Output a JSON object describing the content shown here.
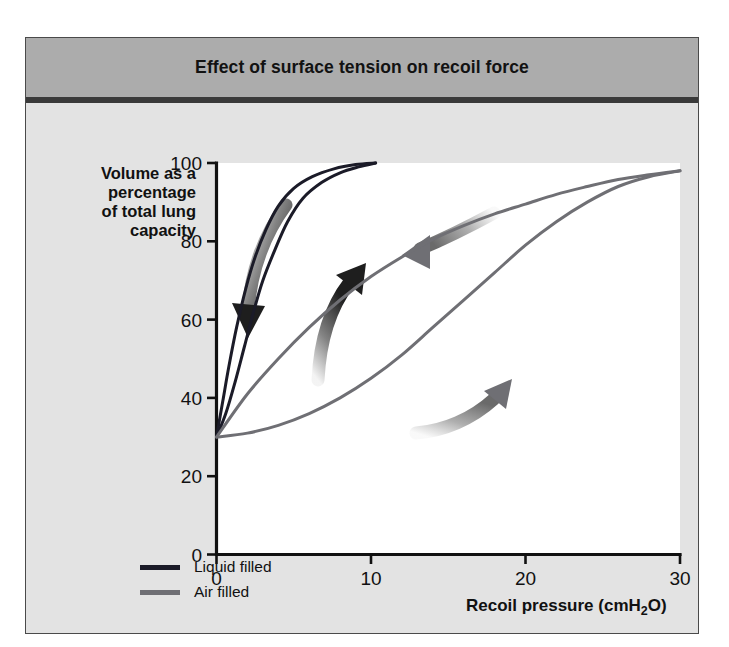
{
  "figure": {
    "title": "Effect of surface tension on recoil force",
    "background_color": "#e3e3e3",
    "title_band_color": "#acacac",
    "plot_background_color": "#ffffff"
  },
  "chart_data": {
    "type": "line",
    "title": "Effect of surface tension on recoil force",
    "xlabel": "Recoil pressure (cmH",
    "xlabel_sub": "2",
    "xlabel_tail": "O)",
    "xlabel_full": "Recoil pressure (cmH2O)",
    "ylabel": "Volume as a percentage of total lung capacity",
    "ylabel_lines": [
      "Volume as a",
      "percentage",
      "of total lung",
      "capacity"
    ],
    "xlim": [
      0,
      30
    ],
    "ylim": [
      0,
      100
    ],
    "xticks": [
      0,
      10,
      20,
      30
    ],
    "xtick_labels": [
      "0",
      "10",
      "20",
      "30"
    ],
    "yticks": [
      0,
      20,
      40,
      60,
      80,
      100
    ],
    "ytick_labels": [
      "0",
      "20",
      "40",
      "60",
      "80",
      "100"
    ],
    "grid": false,
    "legend_position": "below-axes-left",
    "series": [
      {
        "name": "Liquid filled",
        "color": "#1b1b28",
        "limb": "inflation",
        "points": [
          [
            0.0,
            30
          ],
          [
            0.6,
            36
          ],
          [
            1.2,
            44
          ],
          [
            1.8,
            53
          ],
          [
            2.4,
            62
          ],
          [
            3.0,
            70
          ],
          [
            3.8,
            78
          ],
          [
            4.6,
            85
          ],
          [
            5.6,
            91
          ],
          [
            6.8,
            95
          ],
          [
            8.0,
            97.5
          ],
          [
            9.2,
            99
          ],
          [
            10.3,
            100
          ]
        ]
      },
      {
        "name": "Liquid filled",
        "color": "#1b1b28",
        "limb": "deflation",
        "points": [
          [
            0.0,
            30
          ],
          [
            0.4,
            39
          ],
          [
            0.8,
            48
          ],
          [
            1.3,
            58
          ],
          [
            1.9,
            68
          ],
          [
            2.5,
            76
          ],
          [
            3.2,
            83
          ],
          [
            4.0,
            89
          ],
          [
            5.0,
            93.5
          ],
          [
            6.2,
            96.5
          ],
          [
            7.6,
            98.5
          ],
          [
            9.0,
            99.6
          ],
          [
            10.3,
            100
          ]
        ]
      },
      {
        "name": "Air filled",
        "color": "#6f6f74",
        "limb": "inflation",
        "points": [
          [
            0.0,
            30
          ],
          [
            2.0,
            31
          ],
          [
            4.0,
            33
          ],
          [
            6.0,
            36
          ],
          [
            8.0,
            40
          ],
          [
            10.0,
            45
          ],
          [
            12.0,
            51
          ],
          [
            14.0,
            58
          ],
          [
            16.0,
            65
          ],
          [
            18.0,
            72
          ],
          [
            20.0,
            79
          ],
          [
            22.0,
            85
          ],
          [
            24.0,
            90
          ],
          [
            26.0,
            94
          ],
          [
            28.0,
            96.5
          ],
          [
            30.0,
            98
          ]
        ]
      },
      {
        "name": "Air filled",
        "color": "#6f6f74",
        "limb": "deflation",
        "points": [
          [
            0.0,
            30
          ],
          [
            2.0,
            41
          ],
          [
            4.0,
            50
          ],
          [
            6.0,
            58
          ],
          [
            8.0,
            65
          ],
          [
            10.0,
            71
          ],
          [
            12.0,
            76
          ],
          [
            14.0,
            80.5
          ],
          [
            16.0,
            84
          ],
          [
            18.0,
            87
          ],
          [
            20.0,
            89.5
          ],
          [
            22.0,
            92
          ],
          [
            24.0,
            94
          ],
          [
            26.0,
            95.8
          ],
          [
            28.0,
            97
          ],
          [
            30.0,
            98
          ]
        ]
      }
    ],
    "annotations": [
      {
        "name": "liquid-deflation-arrow",
        "direction": "down-left",
        "color": "#1e1e1e"
      },
      {
        "name": "liquid-inflation-arrow",
        "direction": "up-right",
        "color": "#1e1e1e"
      },
      {
        "name": "air-deflation-arrow",
        "direction": "left",
        "color": "#6f6f74"
      },
      {
        "name": "air-inflation-arrow",
        "direction": "up-right",
        "color": "#6f6f74"
      }
    ],
    "legend": [
      {
        "label": "Liquid filled",
        "color": "#1b1b28"
      },
      {
        "label": "Air filled",
        "color": "#6f6f74"
      }
    ]
  }
}
